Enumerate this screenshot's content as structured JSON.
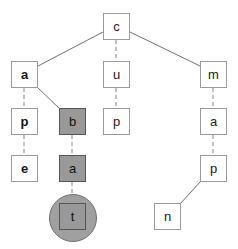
{
  "diagram": {
    "type": "tree",
    "canvas": {
      "width": 238,
      "height": 249
    },
    "colors": {
      "background": "#ffffff",
      "node_fill": "#ffffff",
      "node_border": "#9a9a9a",
      "highlight_fill": "#999999",
      "highlight_border": "#555555",
      "halo_fill": "#a0a0a0",
      "edge_solid": "#707070",
      "edge_dashed": "#9a9a9a",
      "text": "#1a1a1a"
    },
    "nodes": [
      {
        "id": "root",
        "label": "c",
        "x": 103,
        "y": 13,
        "w": 27,
        "h": 27,
        "style": "plain",
        "terminal": false
      },
      {
        "id": "n-a1",
        "label": "a",
        "x": 11,
        "y": 61,
        "w": 27,
        "h": 27,
        "style": "plain-bold",
        "terminal": false
      },
      {
        "id": "n-p1",
        "label": "p",
        "x": 11,
        "y": 108,
        "w": 27,
        "h": 27,
        "style": "plain-bold",
        "terminal": false
      },
      {
        "id": "n-e1",
        "label": "e",
        "x": 11,
        "y": 155,
        "w": 27,
        "h": 27,
        "style": "plain-bold",
        "terminal": false
      },
      {
        "id": "n-b",
        "label": "b",
        "x": 59,
        "y": 108,
        "w": 27,
        "h": 27,
        "style": "highlight",
        "terminal": false
      },
      {
        "id": "n-a2",
        "label": "a",
        "x": 59,
        "y": 155,
        "w": 27,
        "h": 27,
        "style": "highlight",
        "terminal": false
      },
      {
        "id": "n-t",
        "label": "t",
        "x": 59,
        "y": 203,
        "w": 27,
        "h": 27,
        "style": "highlight",
        "terminal": true
      },
      {
        "id": "n-u",
        "label": "u",
        "x": 103,
        "y": 61,
        "w": 27,
        "h": 27,
        "style": "plain",
        "terminal": false
      },
      {
        "id": "n-p2",
        "label": "p",
        "x": 103,
        "y": 108,
        "w": 27,
        "h": 27,
        "style": "plain",
        "terminal": false
      },
      {
        "id": "n-m",
        "label": "m",
        "x": 200,
        "y": 61,
        "w": 27,
        "h": 27,
        "style": "plain",
        "terminal": false
      },
      {
        "id": "n-a3",
        "label": "a",
        "x": 200,
        "y": 108,
        "w": 27,
        "h": 27,
        "style": "plain",
        "terminal": false
      },
      {
        "id": "n-p3",
        "label": "p",
        "x": 200,
        "y": 155,
        "w": 27,
        "h": 27,
        "style": "plain",
        "terminal": false
      },
      {
        "id": "n-n",
        "label": "n",
        "x": 154,
        "y": 203,
        "w": 27,
        "h": 27,
        "style": "plain",
        "terminal": false
      }
    ],
    "terminal_halo": {
      "cx": 72,
      "cy": 217,
      "r": 23
    },
    "edges": [
      {
        "from": "root",
        "to": "n-a1",
        "kind": "solid",
        "x1": 103,
        "y1": 32,
        "x2": 38,
        "y2": 66
      },
      {
        "from": "root",
        "to": "n-u",
        "kind": "dashed",
        "x1": 116,
        "y1": 40,
        "x2": 116,
        "y2": 61
      },
      {
        "from": "root",
        "to": "n-m",
        "kind": "solid",
        "x1": 130,
        "y1": 32,
        "x2": 200,
        "y2": 66
      },
      {
        "from": "n-a1",
        "to": "n-p1",
        "kind": "dashed",
        "x1": 24,
        "y1": 88,
        "x2": 24,
        "y2": 108
      },
      {
        "from": "n-p1",
        "to": "n-e1",
        "kind": "dashed",
        "x1": 24,
        "y1": 135,
        "x2": 24,
        "y2": 155
      },
      {
        "from": "n-a1",
        "to": "n-b",
        "kind": "solid",
        "x1": 36,
        "y1": 86,
        "x2": 60,
        "y2": 109
      },
      {
        "from": "n-b",
        "to": "n-a2",
        "kind": "dashed",
        "x1": 72,
        "y1": 135,
        "x2": 72,
        "y2": 155
      },
      {
        "from": "n-a2",
        "to": "n-t",
        "kind": "dashed",
        "x1": 72,
        "y1": 182,
        "x2": 72,
        "y2": 203
      },
      {
        "from": "n-u",
        "to": "n-p2",
        "kind": "dashed",
        "x1": 116,
        "y1": 88,
        "x2": 116,
        "y2": 108
      },
      {
        "from": "n-m",
        "to": "n-a3",
        "kind": "dashed",
        "x1": 213,
        "y1": 88,
        "x2": 213,
        "y2": 108
      },
      {
        "from": "n-a3",
        "to": "n-p3",
        "kind": "dashed",
        "x1": 213,
        "y1": 135,
        "x2": 213,
        "y2": 155
      },
      {
        "from": "n-p3",
        "to": "n-n",
        "kind": "solid",
        "x1": 201,
        "y1": 181,
        "x2": 180,
        "y2": 204
      }
    ]
  }
}
